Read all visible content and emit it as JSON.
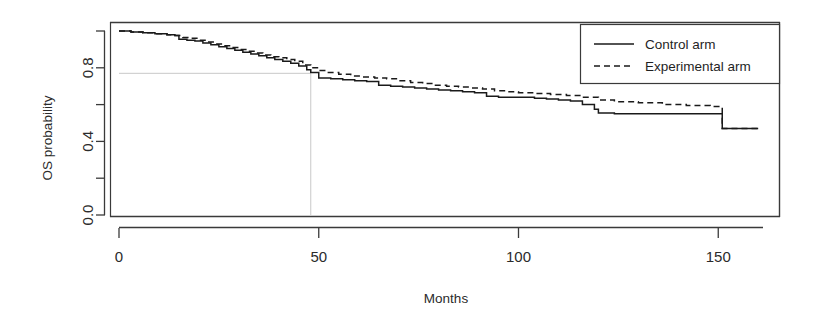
{
  "chart_data": {
    "type": "line",
    "subtype": "kaplan-meier-step",
    "title": "",
    "xlabel": "Months",
    "ylabel": "OS probability",
    "xlim": [
      0,
      167
    ],
    "ylim": [
      0,
      1.06
    ],
    "xticks": [
      0,
      50,
      100,
      150
    ],
    "xtick_labels": [
      "0",
      "50",
      "100",
      "150"
    ],
    "yticks": [
      0.0,
      0.2,
      0.4,
      0.6,
      0.8,
      1.0
    ],
    "ytick_labels": [
      "0.0",
      "",
      "0.4",
      "",
      "0.8",
      ""
    ],
    "ytick_labels_shown": [
      "0.0",
      "0.4",
      "0.8"
    ],
    "grid": false,
    "legend_position": "top-right",
    "legend": [
      "Control arm",
      "Experimental arm"
    ],
    "annotations": [
      {
        "name": "median-reference-lines",
        "type": "reference-crosshair",
        "x": 48,
        "y": 0.77,
        "color": "#c8c8c8",
        "description": "Horizontal guide at OS probability 0.77 meeting vertical guide at 48 months"
      }
    ],
    "series": [
      {
        "name": "Control arm",
        "style": "solid",
        "color": "#1a1a1a",
        "x": [
          0,
          3,
          6,
          9,
          12,
          14,
          15,
          17,
          19,
          21,
          23,
          25,
          27,
          29,
          31,
          33,
          35,
          37,
          39,
          41,
          43,
          45,
          47,
          48,
          50,
          53,
          56,
          59,
          62,
          65,
          68,
          71,
          74,
          77,
          80,
          83,
          86,
          89,
          92,
          95,
          98,
          101,
          104,
          107,
          110,
          113,
          116,
          119,
          120,
          124,
          128,
          132,
          136,
          140,
          144,
          148,
          150,
          151,
          155,
          160
        ],
        "y": [
          1.0,
          0.995,
          0.99,
          0.985,
          0.98,
          0.975,
          0.955,
          0.95,
          0.945,
          0.935,
          0.925,
          0.915,
          0.905,
          0.895,
          0.885,
          0.875,
          0.865,
          0.855,
          0.845,
          0.835,
          0.825,
          0.81,
          0.79,
          0.775,
          0.745,
          0.74,
          0.735,
          0.73,
          0.725,
          0.705,
          0.7,
          0.695,
          0.69,
          0.685,
          0.68,
          0.675,
          0.67,
          0.665,
          0.645,
          0.64,
          0.64,
          0.64,
          0.635,
          0.63,
          0.625,
          0.62,
          0.6,
          0.575,
          0.555,
          0.55,
          0.55,
          0.55,
          0.55,
          0.55,
          0.55,
          0.55,
          0.55,
          0.47,
          0.47,
          0.47
        ]
      },
      {
        "name": "Experimental arm",
        "style": "dashed",
        "color": "#1a1a1a",
        "x": [
          0,
          3,
          6,
          9,
          12,
          14,
          16,
          18,
          20,
          22,
          24,
          26,
          28,
          30,
          32,
          34,
          36,
          38,
          40,
          42,
          44,
          46,
          48,
          50,
          52,
          55,
          58,
          61,
          64,
          67,
          70,
          73,
          76,
          79,
          82,
          85,
          88,
          91,
          94,
          97,
          100,
          104,
          108,
          112,
          116,
          120,
          124,
          130,
          136,
          142,
          148,
          150,
          151,
          155,
          160
        ],
        "y": [
          1.0,
          0.995,
          0.99,
          0.985,
          0.98,
          0.975,
          0.965,
          0.96,
          0.95,
          0.94,
          0.93,
          0.92,
          0.91,
          0.9,
          0.89,
          0.88,
          0.87,
          0.86,
          0.855,
          0.845,
          0.835,
          0.815,
          0.8,
          0.785,
          0.775,
          0.765,
          0.755,
          0.75,
          0.745,
          0.74,
          0.73,
          0.72,
          0.715,
          0.705,
          0.7,
          0.695,
          0.69,
          0.685,
          0.675,
          0.67,
          0.665,
          0.66,
          0.655,
          0.65,
          0.64,
          0.625,
          0.615,
          0.61,
          0.6,
          0.595,
          0.59,
          0.59,
          0.47,
          0.47,
          0.47
        ]
      }
    ]
  },
  "axes": {
    "x_title": "Months",
    "y_title": "OS probability",
    "x_tick_labels": [
      "0",
      "50",
      "100",
      "150"
    ],
    "y_tick_labels": [
      "0.0",
      "0.4",
      "0.8"
    ]
  },
  "legend": {
    "entries": [
      {
        "label": "Control arm",
        "style": "solid"
      },
      {
        "label": "Experimental arm",
        "style": "dashed"
      }
    ]
  },
  "colors": {
    "line": "#1a1a1a",
    "axis": "#3a3a3a",
    "reference": "#c9c9c9",
    "background": "#ffffff"
  }
}
